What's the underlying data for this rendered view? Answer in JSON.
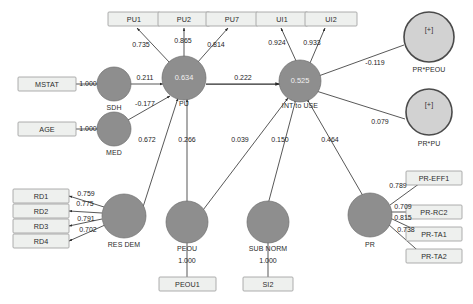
{
  "diagram": {
    "colors": {
      "latent_fill": "#8e8e8e",
      "moderator_fill": "#d2d2d2",
      "indicator_fill": "#eef0ee",
      "edge": "#3a3a3a",
      "background": "#ffffff"
    },
    "indicators": [
      {
        "id": "pu1",
        "label": "PU1"
      },
      {
        "id": "pu2",
        "label": "PU2"
      },
      {
        "id": "pu7",
        "label": "PU7"
      },
      {
        "id": "ui1",
        "label": "UI1"
      },
      {
        "id": "ui2",
        "label": "UI2"
      },
      {
        "id": "mstat",
        "label": "MSTAT"
      },
      {
        "id": "age",
        "label": "AGE"
      },
      {
        "id": "rd1",
        "label": "RD1"
      },
      {
        "id": "rd2",
        "label": "RD2"
      },
      {
        "id": "rd3",
        "label": "RD3"
      },
      {
        "id": "rd4",
        "label": "RD4"
      },
      {
        "id": "peou1",
        "label": "PEOU1"
      },
      {
        "id": "si2",
        "label": "SI2"
      },
      {
        "id": "pr_eff1",
        "label": "PR-EFF1"
      },
      {
        "id": "pr_rc2",
        "label": "PR-RC2"
      },
      {
        "id": "pr_ta1",
        "label": "PR-TA1"
      },
      {
        "id": "pr_ta2",
        "label": "PR-TA2"
      }
    ],
    "latents": [
      {
        "id": "sdh",
        "caption": "SDH",
        "inner": ""
      },
      {
        "id": "pu",
        "caption": "PU",
        "inner": "0.634"
      },
      {
        "id": "int_use",
        "caption": "INT to USE",
        "inner": "0.525"
      },
      {
        "id": "med",
        "caption": "MED",
        "inner": ""
      },
      {
        "id": "res_dem",
        "caption": "RES DEM",
        "inner": ""
      },
      {
        "id": "peou",
        "caption": "PEOU",
        "inner": ""
      },
      {
        "id": "sub_norm",
        "caption": "SUB NORM",
        "inner": ""
      },
      {
        "id": "pr",
        "caption": "PR",
        "inner": ""
      }
    ],
    "moderators": [
      {
        "id": "pr_x_peou",
        "caption": "PR*PEOU",
        "inner": "[+]"
      },
      {
        "id": "pr_x_pu",
        "caption": "PR*PU",
        "inner": "[+]"
      }
    ],
    "coefficients": {
      "pu_to_pu1": "0.735",
      "pu_to_pu2": "0.865",
      "pu_to_pu7": "0.814",
      "int_to_ui1": "0.924",
      "int_to_ui2": "0.933",
      "mstat_to_sdh": "1.000",
      "sdh_to_pu": "0.211",
      "age_to_med": "1.000",
      "med_to_pu": "-0.177",
      "res_dem_to_pu": "0.672",
      "peou_to_pu": "0.266",
      "pu_to_int": "0.222",
      "peou_to_int": "0.039",
      "sub_norm_to_int": "0.150",
      "pr_to_int": "0.464",
      "pr_x_peou_to_int": "-0.119",
      "pr_x_pu_to_int": "0.079",
      "res_dem_to_rd1": "0.759",
      "res_dem_to_rd2": "0.775",
      "res_dem_to_rd3": "0.791",
      "res_dem_to_rd4": "0.702",
      "peou_to_peou1": "1.000",
      "sub_norm_to_si2": "1.000",
      "pr_to_pr_eff1": "0.789",
      "pr_to_pr_rc2": "0.709",
      "pr_to_pr_ta1": "0.815",
      "pr_to_pr_ta2": "0.738"
    }
  }
}
